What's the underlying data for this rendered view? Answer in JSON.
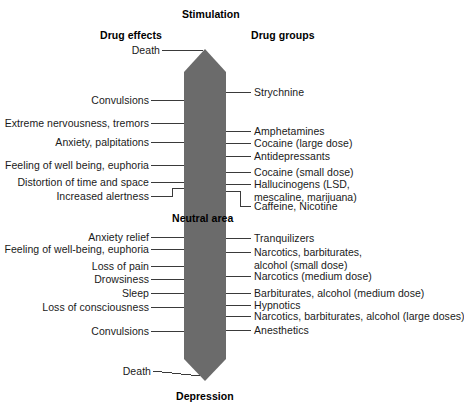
{
  "diagram": {
    "title_top": "Stimulation",
    "title_bottom": "Depression",
    "column_left_header": "Drug effects",
    "column_right_header": "Drug groups",
    "neutral_label": "Neutral area",
    "bar_color": "#6b6b6b",
    "line_color": "#3a3a3a",
    "background_color": "#ffffff",
    "text_color": "#1a1a1a"
  },
  "left_effects": [
    {
      "label": "Death",
      "y": 50
    },
    {
      "label": "Convulsions",
      "y": 100
    },
    {
      "label": "Extreme nervousness, tremors",
      "y": 123
    },
    {
      "label": "Anxiety, palpitations",
      "y": 142
    },
    {
      "label": "Feeling of well being, euphoria",
      "y": 165
    },
    {
      "label": "Distortion of time and space",
      "y": 182
    },
    {
      "label": "Increased alertness",
      "y": 196
    },
    {
      "label": "Anxiety relief",
      "y": 237
    },
    {
      "label": "Feeling of well-being, euphoria",
      "y": 249
    },
    {
      "label": "Loss of pain",
      "y": 266
    },
    {
      "label": "Drowsiness",
      "y": 279
    },
    {
      "label": "Sleep",
      "y": 293
    },
    {
      "label": "Loss of consciousness",
      "y": 307
    },
    {
      "label": "Convulsions",
      "y": 331
    },
    {
      "label": "Death",
      "y": 371
    }
  ],
  "right_groups": [
    {
      "label": "Strychnine",
      "y": 92
    },
    {
      "label": "Amphetamines",
      "y": 131
    },
    {
      "label": "Cocaine (large dose)",
      "y": 143
    },
    {
      "label": "Antidepressants",
      "y": 156
    },
    {
      "label": "Cocaine (small dose)",
      "y": 172
    },
    {
      "label": "Hallucinogens (LSD,",
      "y": 184,
      "line2": "mescaline, marijuana)"
    },
    {
      "label": "Caffeine, Nicotine",
      "y": 206
    },
    {
      "label": "Tranquilizers",
      "y": 238
    },
    {
      "label": "Narcotics, barbiturates,",
      "y": 252,
      "line2": "alcohol (small dose)"
    },
    {
      "label": "Narcotics (medium dose)",
      "y": 276
    },
    {
      "label": "Barbiturates, alcohol (medium dose)",
      "y": 293
    },
    {
      "label": "Hypnotics",
      "y": 305
    },
    {
      "label": "Narcotics, barbiturates, alcohol (large doses)",
      "y": 316
    },
    {
      "label": "Anesthetics",
      "y": 330
    }
  ]
}
